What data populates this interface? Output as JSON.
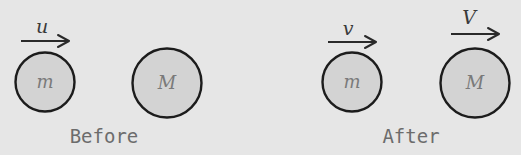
{
  "diagram": {
    "colors": {
      "background": "#e6e6e6",
      "ball_fill": "#d3d3d3",
      "ball_stroke": "#1c1c1c",
      "arrow": "#2a2a2a",
      "mass_label": "#7a7a7a",
      "caption": "#6c6c6c"
    },
    "before": {
      "caption": "Before",
      "small_ball": {
        "label": "m",
        "velocity_label": "u"
      },
      "large_ball": {
        "label": "M"
      }
    },
    "after": {
      "caption": "After",
      "small_ball": {
        "label": "m",
        "velocity_label": "v"
      },
      "large_ball": {
        "label": "M",
        "velocity_label": "V"
      }
    }
  }
}
